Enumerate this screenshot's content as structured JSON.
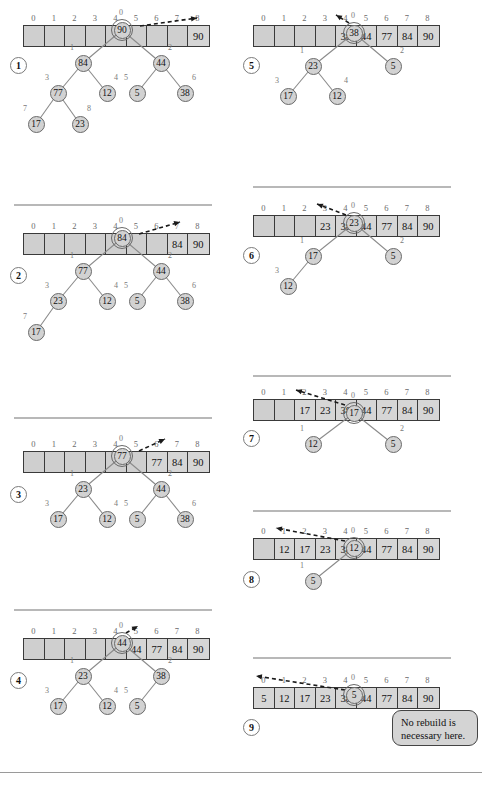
{
  "figure": {
    "array_size": 9,
    "indices": [
      0,
      1,
      2,
      3,
      4,
      5,
      6,
      7,
      8
    ],
    "callout_text_line1": "No rebuild is",
    "callout_text_line2": "necessary here.",
    "colors": {
      "cell_fill": "#cfcfcf",
      "cell_border": "#3a3a3a",
      "node_fill": "#d2d2d2",
      "node_border": "#6a6a6a",
      "label_color": "#7a7a7a",
      "divider": "#b8b8b8",
      "callout_fill": "#d4d4d4"
    }
  },
  "steps": [
    {
      "number": "1",
      "array": [
        "",
        "",
        "",
        "",
        "",
        "",
        "",
        "",
        "90"
      ],
      "filled_from": 8,
      "tree": {
        "nodes": [
          {
            "label": "0",
            "value": "90",
            "root": true
          },
          {
            "label": "1",
            "value": "84",
            "root": false
          },
          {
            "label": "2",
            "value": "44",
            "root": false
          },
          {
            "label": "3",
            "value": "77",
            "root": false
          },
          {
            "label": "4",
            "value": "12",
            "root": false
          },
          {
            "label": "5",
            "value": "5",
            "root": false
          },
          {
            "label": "6",
            "value": "38",
            "root": false
          },
          {
            "label": "7",
            "value": "17",
            "root": false
          },
          {
            "label": "8",
            "value": "23",
            "root": false
          }
        ]
      }
    },
    {
      "number": "2",
      "array": [
        "",
        "",
        "",
        "",
        "",
        "",
        "",
        "84",
        "90"
      ],
      "filled_from": 7,
      "tree": {
        "nodes": [
          {
            "label": "0",
            "value": "84",
            "root": true
          },
          {
            "label": "1",
            "value": "77",
            "root": false
          },
          {
            "label": "2",
            "value": "44",
            "root": false
          },
          {
            "label": "3",
            "value": "23",
            "root": false
          },
          {
            "label": "4",
            "value": "12",
            "root": false
          },
          {
            "label": "5",
            "value": "5",
            "root": false
          },
          {
            "label": "6",
            "value": "38",
            "root": false
          },
          {
            "label": "7",
            "value": "17",
            "root": false
          }
        ]
      }
    },
    {
      "number": "3",
      "array": [
        "",
        "",
        "",
        "",
        "",
        "",
        "77",
        "84",
        "90"
      ],
      "filled_from": 6,
      "tree": {
        "nodes": [
          {
            "label": "0",
            "value": "77",
            "root": true
          },
          {
            "label": "1",
            "value": "23",
            "root": false
          },
          {
            "label": "2",
            "value": "44",
            "root": false
          },
          {
            "label": "3",
            "value": "17",
            "root": false
          },
          {
            "label": "4",
            "value": "12",
            "root": false
          },
          {
            "label": "5",
            "value": "5",
            "root": false
          },
          {
            "label": "6",
            "value": "38",
            "root": false
          }
        ]
      }
    },
    {
      "number": "4",
      "array": [
        "",
        "",
        "",
        "",
        "",
        "44",
        "77",
        "84",
        "90"
      ],
      "filled_from": 5,
      "tree": {
        "nodes": [
          {
            "label": "0",
            "value": "44",
            "root": true
          },
          {
            "label": "1",
            "value": "23",
            "root": false
          },
          {
            "label": "2",
            "value": "38",
            "root": false
          },
          {
            "label": "3",
            "value": "17",
            "root": false
          },
          {
            "label": "4",
            "value": "12",
            "root": false
          },
          {
            "label": "5",
            "value": "5",
            "root": false
          }
        ]
      }
    },
    {
      "number": "5",
      "array": [
        "",
        "",
        "",
        "",
        "38",
        "44",
        "77",
        "84",
        "90"
      ],
      "filled_from": 4,
      "tree": {
        "nodes": [
          {
            "label": "0",
            "value": "38",
            "root": true
          },
          {
            "label": "1",
            "value": "23",
            "root": false
          },
          {
            "label": "2",
            "value": "5",
            "root": false
          },
          {
            "label": "3",
            "value": "17",
            "root": false
          },
          {
            "label": "4",
            "value": "12",
            "root": false
          }
        ]
      }
    },
    {
      "number": "6",
      "array": [
        "",
        "",
        "",
        "23",
        "38",
        "44",
        "77",
        "84",
        "90"
      ],
      "filled_from": 3,
      "tree": {
        "nodes": [
          {
            "label": "0",
            "value": "23",
            "root": true
          },
          {
            "label": "1",
            "value": "17",
            "root": false
          },
          {
            "label": "2",
            "value": "5",
            "root": false
          },
          {
            "label": "3",
            "value": "12",
            "root": false
          }
        ]
      }
    },
    {
      "number": "7",
      "array": [
        "",
        "",
        "17",
        "23",
        "38",
        "44",
        "77",
        "84",
        "90"
      ],
      "filled_from": 2,
      "tree": {
        "nodes": [
          {
            "label": "0",
            "value": "17",
            "root": true
          },
          {
            "label": "1",
            "value": "12",
            "root": false
          },
          {
            "label": "2",
            "value": "5",
            "root": false
          }
        ]
      }
    },
    {
      "number": "8",
      "array": [
        "",
        "12",
        "17",
        "23",
        "38",
        "44",
        "77",
        "84",
        "90"
      ],
      "filled_from": 1,
      "tree": {
        "nodes": [
          {
            "label": "0",
            "value": "12",
            "root": true
          },
          {
            "label": "1",
            "value": "5",
            "root": false
          }
        ]
      }
    },
    {
      "number": "9",
      "array": [
        "5",
        "12",
        "17",
        "23",
        "38",
        "44",
        "77",
        "84",
        "90"
      ],
      "filled_from": 0,
      "tree": {
        "nodes": [
          {
            "label": "0",
            "value": "5",
            "root": true
          }
        ]
      }
    }
  ]
}
